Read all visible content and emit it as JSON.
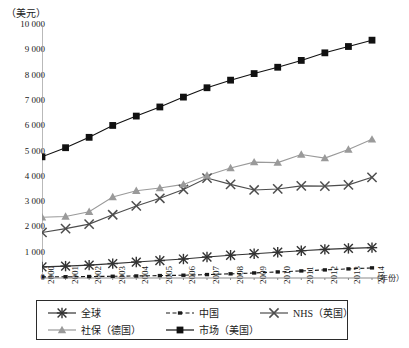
{
  "chart_data": {
    "type": "line",
    "title": "",
    "xlabel": "（年份）",
    "ylabel": "（美元）",
    "ylim": [
      0,
      10000
    ],
    "ytick_labels": [
      "10 000",
      "9 000",
      "8 000",
      "7 000",
      "6 000",
      "5 000",
      "4 000",
      "3 000",
      "2 000",
      "1 000",
      "0"
    ],
    "ytick_values": [
      10000,
      9000,
      8000,
      7000,
      6000,
      5000,
      4000,
      3000,
      2000,
      1000,
      0
    ],
    "grid": false,
    "legend_position": "bottom",
    "categories": [
      "2000",
      "2001",
      "2002",
      "2003",
      "2004",
      "2005",
      "2006",
      "2007",
      "2008",
      "2009",
      "2010",
      "2011",
      "2012",
      "2013",
      "2014"
    ],
    "series": [
      {
        "name": "全球",
        "marker": "asterisk",
        "color": "#333333",
        "dash": "solid",
        "values": [
          440,
          470,
          510,
          570,
          630,
          690,
          750,
          830,
          900,
          960,
          1020,
          1080,
          1130,
          1170,
          1200
        ]
      },
      {
        "name": "中国",
        "marker": "small-square",
        "color": "#1a1a1a",
        "dash": "dashed",
        "values": [
          45,
          50,
          58,
          68,
          80,
          95,
          110,
          135,
          165,
          200,
          240,
          280,
          320,
          360,
          400
        ]
      },
      {
        "name": "NHS（英国）",
        "marker": "x",
        "color": "#4d4d4d",
        "dash": "solid",
        "values": [
          1800,
          1950,
          2130,
          2500,
          2850,
          3150,
          3500,
          3950,
          3700,
          3480,
          3520,
          3640,
          3630,
          3680,
          3980
        ]
      },
      {
        "name": "社保（德国）",
        "marker": "triangle",
        "color": "#9a9a9a",
        "dash": "solid",
        "values": [
          2400,
          2430,
          2620,
          3200,
          3450,
          3560,
          3700,
          4050,
          4350,
          4580,
          4560,
          4880,
          4740,
          5080,
          5480
        ]
      },
      {
        "name": "市场（美国）",
        "marker": "square",
        "color": "#111111",
        "dash": "solid",
        "values": [
          4790,
          5150,
          5560,
          6030,
          6400,
          6760,
          7150,
          7520,
          7820,
          8080,
          8330,
          8600,
          8900,
          9150,
          9400
        ]
      }
    ]
  },
  "legend": {
    "rows": [
      [
        {
          "label": "全球",
          "marker": "asterisk",
          "color": "#333333",
          "dash": "solid"
        },
        {
          "label": "中国",
          "marker": "small-square",
          "color": "#1a1a1a",
          "dash": "dashed"
        },
        {
          "label": "NHS（英国）",
          "marker": "x",
          "color": "#4d4d4d",
          "dash": "solid"
        }
      ],
      [
        {
          "label": "社保（德国）",
          "marker": "triangle",
          "color": "#9a9a9a",
          "dash": "solid"
        },
        {
          "label": "市场（美国）",
          "marker": "square",
          "color": "#111111",
          "dash": "solid"
        }
      ]
    ]
  },
  "axes": {
    "y_title": "（美元）",
    "x_title": "（年份）",
    "axis_color": "#8a8a8a"
  }
}
